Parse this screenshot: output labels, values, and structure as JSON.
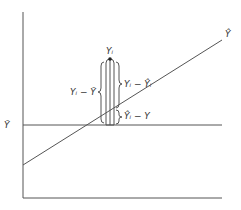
{
  "diagram": {
    "labels": {
      "y_hat_line": "Ŷ",
      "y_bar": "Ȳ",
      "y_i": "Yᵢ",
      "total_dev": "Yᵢ − Ȳ",
      "residual": "Yᵢ − Ŷᵢ",
      "explained": "Ŷᵢ − Y"
    },
    "colors": {
      "line": "#555555",
      "text": "#333333",
      "background": "#ffffff"
    }
  }
}
